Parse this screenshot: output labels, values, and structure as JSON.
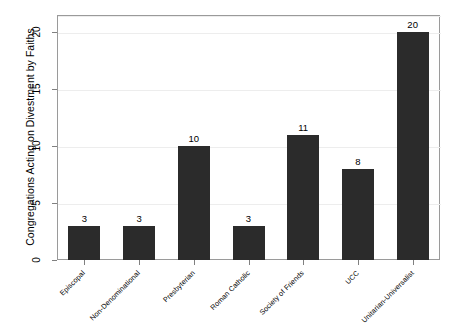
{
  "chart_data": {
    "type": "bar",
    "title": "",
    "subtitle": "",
    "xlabel": "",
    "ylabel": "Congregations Acting on Divestment by Faiths",
    "categories": [
      "Episcopal",
      "Non-Denominational",
      "Presbyterian",
      "Roman Catholic",
      "Society of Friends",
      "UCC",
      "Unitarian-Universalist"
    ],
    "values": [
      3,
      3,
      10,
      3,
      11,
      8,
      20
    ],
    "value_labels": [
      "3",
      "3",
      "10",
      "3",
      "11",
      "8",
      "20"
    ],
    "ylim": [
      0,
      21.5
    ],
    "y_ticks": [
      0,
      5,
      10,
      15,
      20
    ],
    "y_tick_labels": [
      "0",
      "5",
      "10",
      "15",
      "20"
    ],
    "grid": "horizontal-major",
    "legend": "none",
    "bar_color": "#2b2b2b",
    "background_color": "#ffffff",
    "frame_color": "#9a9a9a",
    "gridline_color": "#ededed",
    "x_tick_label_rotation_deg": 45,
    "y_tick_label_rotation_deg": 90
  }
}
